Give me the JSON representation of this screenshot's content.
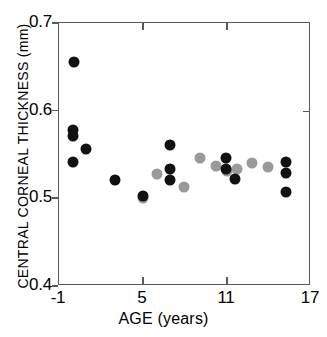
{
  "chart_data": {
    "type": "scatter",
    "title": "",
    "xlabel": "AGE (years)",
    "ylabel": "CENTRAL CORNEAL THICKNESS (mm)",
    "xlim": [
      -1,
      17
    ],
    "ylim": [
      0.4,
      0.7
    ],
    "xticks": [
      -1,
      5,
      11,
      17
    ],
    "xtick_labels": [
      "-1",
      "5",
      "11",
      "17"
    ],
    "yticks": [
      0.4,
      0.5,
      0.6,
      0.7
    ],
    "ytick_labels": [
      "0.4",
      "0.5",
      "0.6",
      "0.7"
    ],
    "grid": false,
    "legend": "none",
    "series": [
      {
        "name": "black",
        "color": "#111111",
        "marker": "circle",
        "points": [
          {
            "x": 0.1,
            "y": 0.655
          },
          {
            "x": 0.0,
            "y": 0.578
          },
          {
            "x": 0.0,
            "y": 0.571
          },
          {
            "x": 0.0,
            "y": 0.542
          },
          {
            "x": 0.9,
            "y": 0.556
          },
          {
            "x": 3.0,
            "y": 0.521
          },
          {
            "x": 5.0,
            "y": 0.503
          },
          {
            "x": 6.9,
            "y": 0.561
          },
          {
            "x": 6.9,
            "y": 0.534
          },
          {
            "x": 6.9,
            "y": 0.521
          },
          {
            "x": 10.9,
            "y": 0.546
          },
          {
            "x": 10.9,
            "y": 0.534
          },
          {
            "x": 11.6,
            "y": 0.522
          },
          {
            "x": 15.2,
            "y": 0.541
          },
          {
            "x": 15.2,
            "y": 0.529
          },
          {
            "x": 15.2,
            "y": 0.507
          }
        ]
      },
      {
        "name": "gray",
        "color": "#9a9a9a",
        "marker": "circle",
        "points": [
          {
            "x": 5.0,
            "y": 0.5
          },
          {
            "x": 6.0,
            "y": 0.528
          },
          {
            "x": 7.9,
            "y": 0.513
          },
          {
            "x": 9.1,
            "y": 0.546
          },
          {
            "x": 10.2,
            "y": 0.537
          },
          {
            "x": 11.0,
            "y": 0.531
          },
          {
            "x": 11.7,
            "y": 0.534
          },
          {
            "x": 12.8,
            "y": 0.54
          },
          {
            "x": 13.9,
            "y": 0.536
          }
        ]
      }
    ]
  }
}
